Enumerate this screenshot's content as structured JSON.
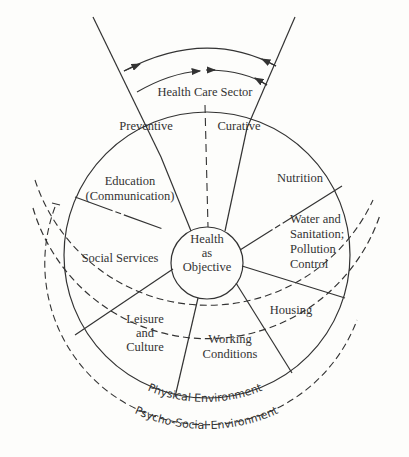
{
  "diagram": {
    "top_label": "Health Care Sector",
    "health_care_parts": [
      "Preventive",
      "Curative"
    ],
    "center": [
      "Health",
      "as",
      "Objective"
    ],
    "sectors": [
      {
        "id": "nutrition",
        "lines": [
          "Nutrition"
        ]
      },
      {
        "id": "water",
        "lines": [
          "Water and",
          "Sanitation;",
          "Pollution",
          "Control"
        ]
      },
      {
        "id": "housing",
        "lines": [
          "Housing"
        ]
      },
      {
        "id": "working",
        "lines": [
          "Working",
          "Conditions"
        ]
      },
      {
        "id": "leisure",
        "lines": [
          "Leisure",
          "and",
          "Culture"
        ]
      },
      {
        "id": "social",
        "lines": [
          "Social Services"
        ]
      },
      {
        "id": "education",
        "lines": [
          "Education",
          "(Communication)"
        ]
      }
    ],
    "outer_ring_1": "Physical Environment",
    "outer_ring_2": "Psycho-Social Environment"
  }
}
